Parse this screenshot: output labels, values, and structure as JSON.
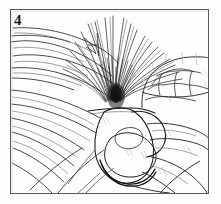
{
  "illustration": {
    "kind": "line-art-diagram",
    "subject": "two hands gripping a bundle of long grass leaves",
    "step_number": "4",
    "frame": {
      "border_color": "#5a5a5a",
      "border_width_px": 1,
      "inset": {
        "left": 10,
        "top": 9,
        "right": 12,
        "bottom": 11
      }
    },
    "background_color": "#fdfdfb",
    "ink_color": "#1a1a1a",
    "light_ink_color": "#8d8d8d",
    "hatch_color": "#b9b9b9",
    "regions": [
      {
        "name": "grass-blade-spray",
        "position": "upper-center"
      },
      {
        "name": "blade-convergence-knot",
        "position": "center"
      },
      {
        "name": "broad-leaves-left",
        "position": "left"
      },
      {
        "name": "knuckles-right-hand",
        "position": "upper-right"
      },
      {
        "name": "gripping-fist",
        "position": "center-lower"
      },
      {
        "name": "fingers-lower-right",
        "position": "lower-right"
      },
      {
        "name": "leaf-blades-lower-left",
        "position": "lower-left"
      }
    ]
  }
}
